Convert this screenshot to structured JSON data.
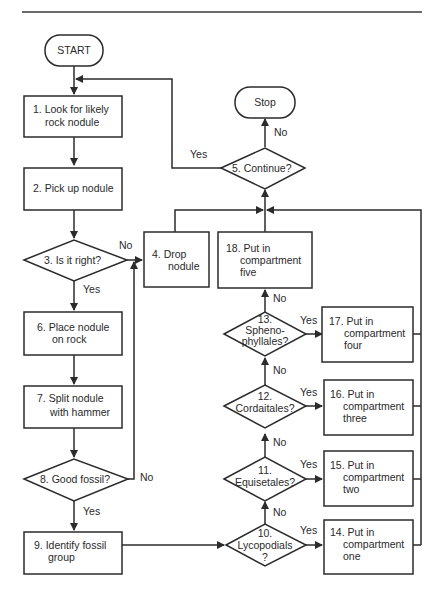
{
  "diagram": {
    "type": "flowchart",
    "terminals": {
      "start": "START",
      "stop": "Stop"
    },
    "nodes": {
      "n1": [
        "1.  Look for likely",
        "rock nodule"
      ],
      "n2": [
        "2.  Pick up nodule"
      ],
      "n3": [
        "3.  Is it right?"
      ],
      "n4": [
        "4.  Drop",
        "nodule"
      ],
      "n5": [
        "5.  Continue?"
      ],
      "n6": [
        "6.  Place nodule",
        "on rock"
      ],
      "n7": [
        "7.  Split nodule",
        "with hammer"
      ],
      "n8": [
        "8.  Good fossil?"
      ],
      "n9": [
        "9.  Identify fossil",
        "group"
      ],
      "n10": [
        "10.",
        "Lycopodials",
        "?"
      ],
      "n11": [
        "11.",
        "Equisetales?"
      ],
      "n12": [
        "12.",
        "Cordaitales?"
      ],
      "n13": [
        "13.",
        "Spheno-",
        "phyllales?"
      ],
      "n14": [
        "14. Put in",
        "compartment",
        "one"
      ],
      "n15": [
        "15. Put in",
        "compartment",
        "two"
      ],
      "n16": [
        "16. Put in",
        "compartment",
        "three"
      ],
      "n17": [
        "17. Put in",
        "compartment",
        "four"
      ],
      "n18": [
        "18. Put in",
        "compartment",
        "five"
      ]
    },
    "edge_labels": {
      "yes": "Yes",
      "no": "No"
    },
    "edges": [
      {
        "from": "start",
        "to": "n1"
      },
      {
        "from": "n1",
        "to": "n2"
      },
      {
        "from": "n2",
        "to": "n3"
      },
      {
        "from": "n3",
        "to": "n6",
        "label": "Yes"
      },
      {
        "from": "n3",
        "to": "n4",
        "label": "No"
      },
      {
        "from": "n6",
        "to": "n7"
      },
      {
        "from": "n7",
        "to": "n8"
      },
      {
        "from": "n8",
        "to": "n9",
        "label": "Yes"
      },
      {
        "from": "n8",
        "to": "n4",
        "label": "No"
      },
      {
        "from": "n9",
        "to": "n10"
      },
      {
        "from": "n10",
        "to": "n14",
        "label": "Yes"
      },
      {
        "from": "n10",
        "to": "n11",
        "label": "No"
      },
      {
        "from": "n11",
        "to": "n15",
        "label": "Yes"
      },
      {
        "from": "n11",
        "to": "n12",
        "label": "No"
      },
      {
        "from": "n12",
        "to": "n16",
        "label": "Yes"
      },
      {
        "from": "n12",
        "to": "n13",
        "label": "No"
      },
      {
        "from": "n13",
        "to": "n17",
        "label": "Yes"
      },
      {
        "from": "n13",
        "to": "n18",
        "label": "No"
      },
      {
        "from": "n4",
        "to": "n5"
      },
      {
        "from": "n18",
        "to": "n5"
      },
      {
        "from": "n14",
        "to": "n5"
      },
      {
        "from": "n15",
        "to": "n5"
      },
      {
        "from": "n16",
        "to": "n5"
      },
      {
        "from": "n17",
        "to": "n5"
      },
      {
        "from": "n5",
        "to": "n1",
        "label": "Yes"
      },
      {
        "from": "n5",
        "to": "stop",
        "label": "No"
      }
    ]
  }
}
